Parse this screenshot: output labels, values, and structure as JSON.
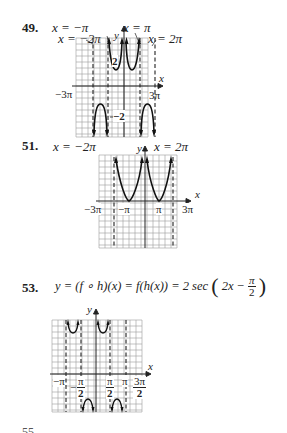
{
  "problems": [
    {
      "number": "49.",
      "labels": {
        "asym_neg_pi": "x = −π",
        "asym_neg_2pi": "x = −2π",
        "asym_pi": "x = π",
        "asym_2pi": "x = 2π",
        "y_axis": "y",
        "x_axis": "x",
        "tick_neg_3pi": "−3π",
        "tick_3pi": "3π",
        "value_2": "2",
        "value_neg_2": "−2"
      }
    },
    {
      "number": "51.",
      "labels": {
        "asym_neg_2pi": "x = −2π",
        "asym_2pi": "x = 2π",
        "y_axis": "y",
        "x_axis": "x",
        "tick_neg_3pi": "−3π",
        "tick_neg_pi": "−π",
        "tick_pi": "π",
        "tick_3pi": "3π"
      }
    },
    {
      "number": "53.",
      "formula": {
        "lhs": "y = (f ∘ h)(x) = f(h(x)) = 2 sec",
        "inner": "2x −",
        "frac_num": "π",
        "frac_den": "2"
      },
      "labels": {
        "y_axis": "y",
        "x_axis": "x",
        "tick_neg_pi": "−π",
        "tick_neg_pi_over_2_num": "π",
        "tick_neg_pi_over_2_den": "2",
        "tick_neg_sign": "−",
        "tick_pi_over_2_num": "π",
        "tick_pi_over_2_den": "2",
        "tick_pi": "π",
        "tick_3pi_over_2_num": "3π",
        "tick_3pi_over_2_den": "2"
      }
    }
  ],
  "footer_clipped": "55.  ..."
}
